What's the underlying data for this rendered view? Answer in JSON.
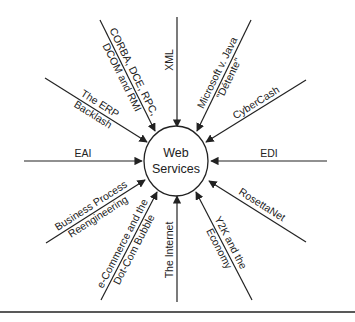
{
  "diagram": {
    "center": {
      "line1": "Web",
      "line2": "Services"
    },
    "influences": [
      {
        "id": "corba",
        "line1": "CORBA, DCE, RPC,",
        "line2": "DCOM and RMI"
      },
      {
        "id": "xml",
        "line1": "XML"
      },
      {
        "id": "microsoft",
        "line1": "Microsoft v. Java",
        "line2": "\"Détente\""
      },
      {
        "id": "cybercash",
        "line1": "CyberCash"
      },
      {
        "id": "edi",
        "line1": "EDI"
      },
      {
        "id": "rosettanet",
        "line1": "RosettaNet"
      },
      {
        "id": "y2k",
        "line1": "Y2K and the",
        "line2": "Economy"
      },
      {
        "id": "internet",
        "line1": "The Internet"
      },
      {
        "id": "ecommerce",
        "line1": "e-Commerce and the",
        "line2": "Dot-Com Bubble"
      },
      {
        "id": "bpr",
        "line1": "Business Process",
        "line2": "Reengineering"
      },
      {
        "id": "eai",
        "line1": "EAI"
      },
      {
        "id": "erp",
        "line1": "The ERP",
        "line2": "Backlash"
      }
    ],
    "colors": {
      "line": "#222222",
      "background": "#ffffff"
    }
  }
}
